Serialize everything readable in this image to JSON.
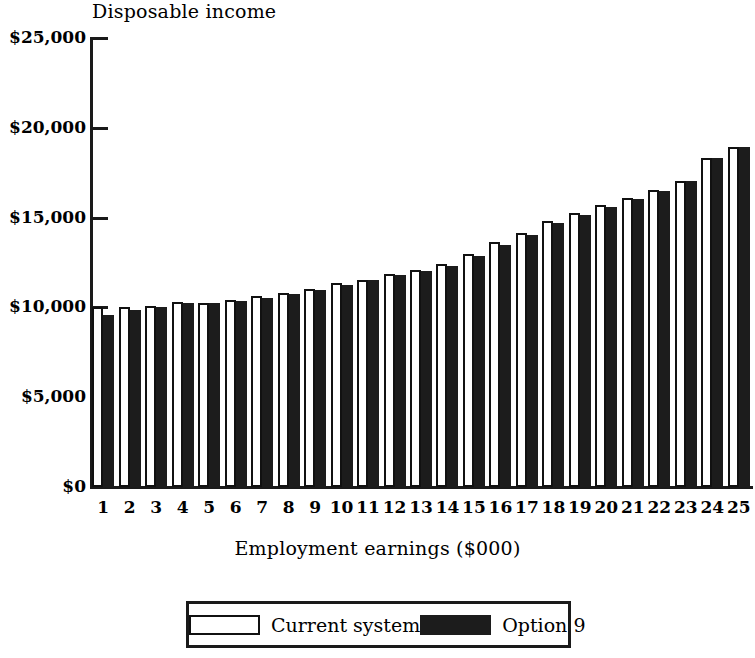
{
  "chart_data": {
    "type": "bar",
    "title": "Disposable income",
    "subtitle": "",
    "xlabel": "Employment earnings ($000)",
    "ylabel": "Disposable income",
    "categories": [
      "1",
      "2",
      "3",
      "4",
      "5",
      "6",
      "7",
      "8",
      "9",
      "10",
      "11",
      "12",
      "13",
      "14",
      "15",
      "16",
      "17",
      "18",
      "19",
      "20",
      "21",
      "22",
      "23",
      "24",
      "25"
    ],
    "series": [
      {
        "name": "Current system",
        "color": "#ffffff",
        "values": [
          10050,
          10000,
          10100,
          10300,
          10250,
          10400,
          10650,
          10800,
          11000,
          11350,
          11550,
          11850,
          12100,
          12400,
          12950,
          13650,
          14150,
          14800,
          15250,
          15700,
          16100,
          16550,
          17050,
          18300,
          18950
        ]
      },
      {
        "name": "Option 9",
        "color": "#1c1c1c",
        "values": [
          9600,
          9850,
          10050,
          10250,
          10250,
          10350,
          10550,
          10750,
          10950,
          11250,
          11550,
          11800,
          12050,
          12300,
          12850,
          13450,
          14050,
          14700,
          15150,
          15600,
          16050,
          16500,
          17050,
          18300,
          18950
        ]
      }
    ],
    "ylim": [
      0,
      25000
    ],
    "yticks": [
      0,
      5000,
      10000,
      15000,
      20000,
      25000
    ],
    "ytick_labels": [
      "$0",
      "$5,000",
      "$10,000",
      "$15,000",
      "$20,000",
      "$25,000"
    ],
    "grid": false,
    "legend_position": "bottom",
    "legend_entries": [
      "Current system",
      "Option 9"
    ]
  }
}
